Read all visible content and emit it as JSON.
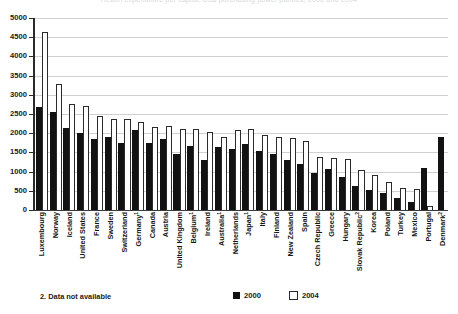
{
  "figure": {
    "title_strip": "Health expenditure per capita, US$ purchasing power parities, 2000 and 2004",
    "footnote": "2. Data not available",
    "legend": {
      "series_2000_label": "2000",
      "series_2004_label": "2004",
      "color_2000": "#111111",
      "color_2004": "#ffffff"
    }
  },
  "chart_data": {
    "type": "bar",
    "title": "",
    "xlabel": "",
    "ylabel": "",
    "ylim": [
      0,
      5000
    ],
    "yticks": [
      0,
      500,
      1000,
      1500,
      2000,
      2500,
      3000,
      3500,
      4000,
      4500,
      5000
    ],
    "ytick_labels": [
      "0",
      "500",
      "1000",
      "1500",
      "2000",
      "2500",
      "3000",
      "3500",
      "4000",
      "4500",
      "5000"
    ],
    "grid": true,
    "legend_position": "bottom-right",
    "categories": [
      "Luxembourg",
      "Norway",
      "Iceland",
      "United States",
      "France",
      "Sweden",
      "Switzerland",
      "Germany",
      "Canada",
      "Austria",
      "United Kingdom",
      "Belgium",
      "Ireland",
      "Australia",
      "Netherlands",
      "Japan",
      "Italy",
      "Finland",
      "New Zealand",
      "Spain",
      "Czech Republic",
      "Greece",
      "Hungary",
      "Slovak Republic",
      "Korea",
      "Poland",
      "Turkey",
      "Mexico",
      "Portugal",
      "Denmark"
    ],
    "category_footnote_marks": {
      "Germany": "1",
      "Belgium": "1",
      "Australia": "1",
      "Japan": "1",
      "Slovak Republic": "2",
      "Denmark": "2"
    },
    "series": [
      {
        "name": "2000",
        "color": "#111111",
        "values": [
          2670,
          2540,
          2140,
          2000,
          1840,
          1910,
          1750,
          2080,
          1750,
          1840,
          1460,
          1670,
          1290,
          1630,
          1600,
          1730,
          1540,
          1450,
          1310,
          1200,
          960,
          1080,
          850,
          620,
          520,
          450,
          300,
          220,
          1100,
          1900
        ]
      },
      {
        "name": "2004",
        "color": "#ffffff",
        "values": [
          4630,
          3290,
          2750,
          2700,
          2460,
          2360,
          2370,
          2300,
          2160,
          2180,
          2120,
          2100,
          2030,
          1890,
          2080,
          2100,
          1960,
          1910,
          1870,
          1790,
          1390,
          1350,
          1340,
          1050,
          900,
          720,
          580,
          560,
          100,
          0
        ]
      }
    ]
  }
}
